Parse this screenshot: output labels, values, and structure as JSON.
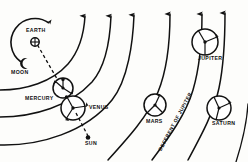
{
  "diagram": {
    "background_color": "#fdfdfb",
    "ink_color": "#111111",
    "width": 248,
    "height": 162
  },
  "labels": {
    "earth": "EARTH",
    "moon": "MOON",
    "mercury": "MERCURY",
    "venus": "VENUS",
    "sun": "SUN",
    "mars": "MARS",
    "jupiter": "JUPITER",
    "saturn": "SATURN",
    "deferent_of_jupiter": "DEFERENT OF JUPITER"
  },
  "bodies": [
    {
      "name": "earth",
      "label": "EARTH",
      "cx": 35,
      "cy": 42,
      "kind": "central-body",
      "glyph": "earth-crossed-circle"
    },
    {
      "name": "moon",
      "label": "MOON",
      "cx": 24,
      "cy": 62,
      "kind": "crescent"
    },
    {
      "name": "mercury",
      "label": "MERCURY",
      "cx": 63,
      "cy": 88,
      "kind": "epicycle",
      "r": 10
    },
    {
      "name": "venus",
      "label": "VENUS",
      "cx": 73,
      "cy": 108,
      "kind": "epicycle",
      "r": 12
    },
    {
      "name": "sun",
      "label": "SUN",
      "cx": 88,
      "cy": 138,
      "kind": "point"
    },
    {
      "name": "mars",
      "label": "MARS",
      "cx": 155,
      "cy": 105,
      "kind": "epicycle",
      "r": 11
    },
    {
      "name": "jupiter",
      "label": "JUPITER",
      "cx": 205,
      "cy": 42,
      "kind": "epicycle",
      "r": 13
    },
    {
      "name": "saturn",
      "label": "SATURN",
      "cx": 219,
      "cy": 108,
      "kind": "epicycle",
      "r": 12
    }
  ],
  "arcs": {
    "count": 7,
    "description": "Nested deferent arcs sweeping from lower-left to upper-right, each tipped with an arrowhead"
  },
  "label_positions": {
    "earth": {
      "x": 26,
      "y": 31,
      "rotate": 0
    },
    "moon": {
      "x": 12,
      "y": 71,
      "rotate": 0
    },
    "mercury": {
      "x": 26,
      "y": 97,
      "rotate": 0
    },
    "venus": {
      "x": 90,
      "y": 106,
      "rotate": 0
    },
    "sun": {
      "x": 86,
      "y": 142,
      "rotate": 0
    },
    "mars": {
      "x": 147,
      "y": 122,
      "rotate": 0
    },
    "jupiter": {
      "x": 198,
      "y": 58,
      "rotate": 0
    },
    "saturn": {
      "x": 213,
      "y": 123,
      "rotate": 0
    },
    "deferent_of_jupiter": {
      "x": 162,
      "y": 148,
      "rotate": -62
    }
  }
}
